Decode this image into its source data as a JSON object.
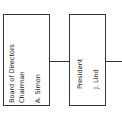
{
  "diagram": {
    "type": "org-chart",
    "nodes": [
      {
        "id": "board",
        "line1": "Board of Directors",
        "line2": "Chairman",
        "name": "A. Simon"
      },
      {
        "id": "president",
        "line1": "President",
        "name": "J. Lind"
      }
    ],
    "edges": [
      {
        "from": "board",
        "to": "president"
      },
      {
        "from": "president",
        "to": "offscreen-right"
      }
    ]
  }
}
